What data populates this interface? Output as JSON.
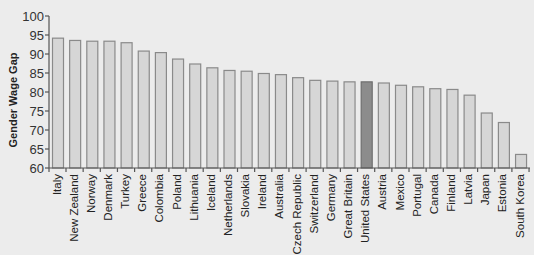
{
  "chart_data": {
    "type": "bar",
    "title": "",
    "xlabel": "",
    "ylabel": "Gender Wage Gap",
    "ylim": [
      60,
      100
    ],
    "yticks": [
      60,
      65,
      70,
      75,
      80,
      85,
      90,
      95,
      100
    ],
    "grid": false,
    "legend": null,
    "categories": [
      "Italy",
      "New Zealand",
      "Norway",
      "Denmark",
      "Turkey",
      "Greece",
      "Colombia",
      "Poland",
      "Lithuania",
      "Iceland",
      "Netherlands",
      "Slovakia",
      "Ireland",
      "Australia",
      "Czech Republic",
      "Switzerland",
      "Germany",
      "Great Britain",
      "United States",
      "Austria",
      "Mexico",
      "Portugal",
      "Canada",
      "Finland",
      "Latvia",
      "Japan",
      "Estonia",
      "South Korea"
    ],
    "values": [
      94.3,
      93.7,
      93.5,
      93.5,
      93.1,
      90.9,
      90.5,
      88.8,
      87.5,
      86.5,
      85.8,
      85.6,
      85.0,
      84.7,
      83.9,
      83.2,
      83.0,
      82.8,
      82.8,
      82.5,
      81.9,
      81.5,
      81.0,
      80.8,
      79.3,
      74.6,
      72.1,
      63.7
    ],
    "highlight": "United States",
    "colors": {
      "bar_fill": "#d6d6d6",
      "bar_stroke": "#8a8a8a",
      "highlight_fill": "#8c8c8c",
      "highlight_stroke": "#6e6e6e",
      "axis": "#555555",
      "background": "#ececec"
    }
  }
}
